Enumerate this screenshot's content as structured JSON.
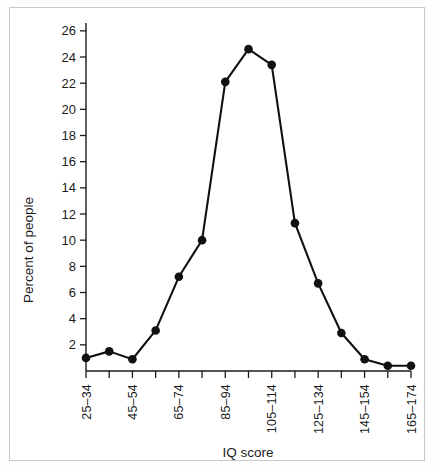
{
  "figure": {
    "background_color": "#ffffff",
    "frame_color": "#c9c9c9",
    "line_color": "#111111"
  },
  "chart_data": {
    "type": "line",
    "title": "",
    "subtitle": "",
    "xlabel": "IQ score",
    "ylabel": "Percent of people",
    "grid": false,
    "legend": "none",
    "marker": "filled-circle",
    "categories": [
      "25–34",
      "35–44",
      "45–54",
      "55–64",
      "65–74",
      "75–84",
      "85–94",
      "95–104",
      "105–114",
      "115–124",
      "125–134",
      "135–144",
      "145–154",
      "155–164",
      "165–174"
    ],
    "tick_labels_shown": [
      "25–34",
      "",
      "45–54",
      "",
      "65–74",
      "",
      "85–94",
      "",
      "105–114",
      "",
      "125–134",
      "",
      "145–154",
      "",
      "165–174"
    ],
    "values": [
      1.0,
      1.5,
      0.9,
      3.1,
      7.2,
      10.0,
      22.1,
      24.6,
      23.4,
      11.3,
      6.7,
      2.9,
      0.9,
      0.4,
      0.4
    ],
    "ylim": [
      0,
      26.6
    ],
    "xlim_index": [
      0,
      14
    ],
    "yticks": [
      2,
      4,
      6,
      8,
      10,
      12,
      14,
      16,
      18,
      20,
      22,
      24,
      26
    ],
    "ytick_labels": [
      "2",
      "4",
      "6",
      "8",
      "10",
      "12",
      "14",
      "16",
      "18",
      "20",
      "22",
      "24",
      "26"
    ]
  },
  "axes": {
    "x_title": "IQ score",
    "y_title": "Percent of people"
  }
}
